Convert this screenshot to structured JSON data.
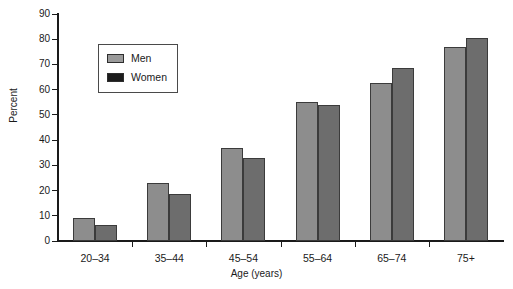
{
  "chart_data": {
    "type": "bar",
    "title": "",
    "subtitle": "",
    "xlabel": "Age (years)",
    "ylabel": "Percent",
    "categories": [
      "20–34",
      "35–44",
      "45–54",
      "55–64",
      "65–74",
      "75+"
    ],
    "series": [
      {
        "name": "Men",
        "color": "#8d8d8d",
        "values": [
          9,
          23,
          37,
          55,
          62.5,
          77
        ]
      },
      {
        "name": "Women",
        "color": "#6d6d6d",
        "values": [
          6.5,
          18.5,
          33,
          54,
          68.5,
          80.5
        ]
      }
    ],
    "ylim": [
      0,
      90
    ],
    "ytick_labels": [
      "0",
      "10",
      "20",
      "30",
      "40",
      "50",
      "60",
      "70",
      "80",
      "90"
    ],
    "ytick_values": [
      0,
      10,
      20,
      30,
      40,
      50,
      60,
      70,
      80,
      90
    ],
    "grid": false,
    "legend_position": "upper-left-inside",
    "legend_entries": [
      "Men",
      "Women"
    ]
  },
  "axes": {
    "y_title": "Percent",
    "x_title": "Age (years)"
  },
  "legend": {
    "items": [
      {
        "label": "Men",
        "swatch": "men-swatch-icon"
      },
      {
        "label": "Women",
        "swatch": "women-swatch-icon"
      }
    ]
  }
}
